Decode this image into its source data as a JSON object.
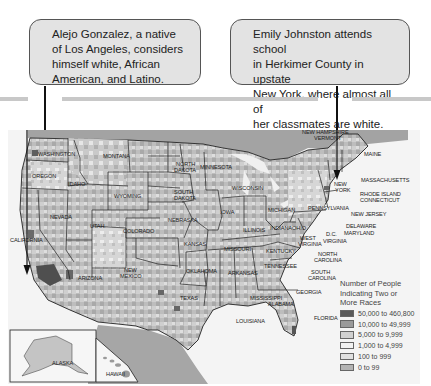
{
  "callouts": [
    {
      "text": "Alejo Gonzalez, a native of Los Angeles, considers himself white, African American, and Latino.",
      "lines": [
        "Alejo Gonzalez, a native",
        "of Los Angeles, considers",
        "himself white, African",
        "American, and Latino."
      ]
    },
    {
      "text": "Emily Johnston attends school in Herkimer County in upstate New York, where almost all of her classmates are white.",
      "lines": [
        "Emily Johnston attends school",
        "in Herkimer County in upstate",
        "New York, where almost all of",
        "her classmates are white."
      ]
    }
  ],
  "map": {
    "states": [
      "WASHINGTON",
      "OREGON",
      "CALIFORNIA",
      "NEVADA",
      "IDAHO",
      "MONTANA",
      "WYOMING",
      "UTAH",
      "ARIZONA",
      "COLORADO",
      "NEW MEXICO",
      "NORTH DAKOTA",
      "SOUTH DAKOTA",
      "NEBRASKA",
      "KANSAS",
      "OKLAHOMA",
      "TEXAS",
      "MINNESOTA",
      "IOWA",
      "MISSOURI",
      "ARKANSAS",
      "LOUISIANA",
      "WISCONSIN",
      "ILLINOIS",
      "MICHIGAN",
      "INDIANA",
      "OHIO",
      "KENTUCKY",
      "TENNESSEE",
      "MISSISSIPPI",
      "ALABAMA",
      "GEORGIA",
      "FLORIDA",
      "SOUTH CAROLINA",
      "NORTH CAROLINA",
      "VIRGINIA",
      "WEST VIRGINIA",
      "D.C.",
      "MARYLAND",
      "DELAWARE",
      "NEW JERSEY",
      "PENNSYLVANIA",
      "NEW YORK",
      "CONNECTICUT",
      "RHODE ISLAND",
      "MASSACHUSETTS",
      "VERMONT",
      "NEW HAMPSHIRE",
      "MAINE",
      "ALASKA",
      "HAWAII"
    ]
  },
  "legend": {
    "title_lines": [
      "Number of People",
      "Indicating Two or",
      "More Races"
    ],
    "items": [
      {
        "label": "50,000 to 460,800",
        "color": "#5a5a5a"
      },
      {
        "label": "10,000 to 49,999",
        "color": "#9a9a9a"
      },
      {
        "label": "5,000 to 9,999",
        "color": "#d0d0d0"
      },
      {
        "label": "1,000 to 4,999",
        "color": "#f2f2f2"
      },
      {
        "label": "100 to 999",
        "color": "#e0e0e0"
      },
      {
        "label": "0 to 99",
        "color": "#b3b3b3"
      }
    ]
  }
}
